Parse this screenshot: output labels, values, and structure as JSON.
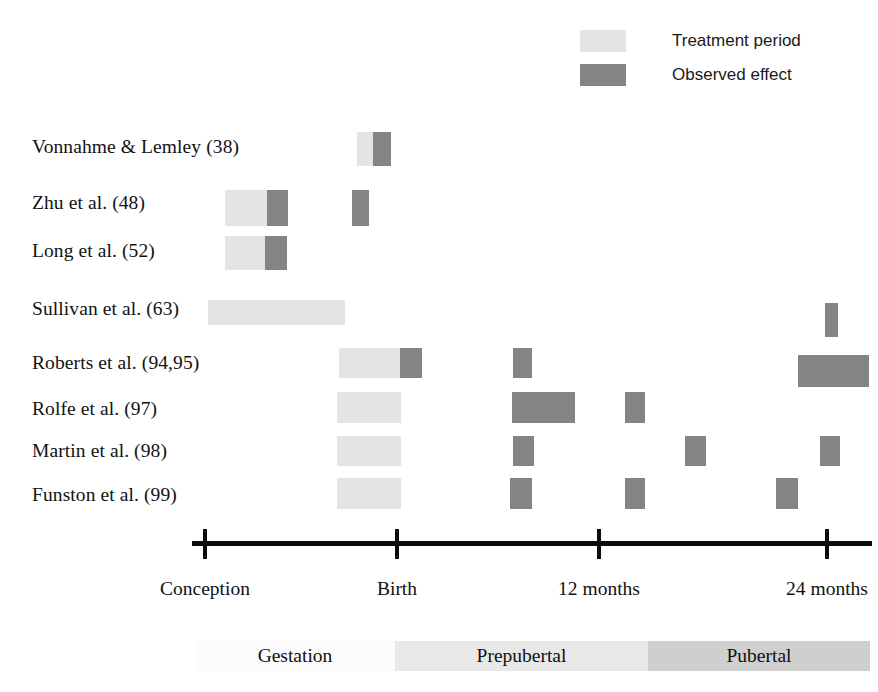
{
  "figure": {
    "type": "timeline-gantt",
    "colors": {
      "treatment": "#e4e4e4",
      "effect": "#848484",
      "axis": "#0b0b0b",
      "stage_gestation": "#fbfbfb",
      "stage_prepubertal": "#e8e8e8",
      "stage_pubertal": "#cfcfcf",
      "background": "#ffffff"
    }
  },
  "legend": {
    "position": "top-right",
    "items": [
      {
        "label": "Treatment period",
        "swatch": "#e4e4e4",
        "key": "treatment"
      },
      {
        "label": "Observed effect",
        "swatch": "#848484",
        "key": "effect"
      }
    ]
  },
  "axis": {
    "ticks": [
      {
        "label": "Conception",
        "x": 205
      },
      {
        "label": "Birth",
        "x": 397
      },
      {
        "label": "12 months",
        "x": 599
      },
      {
        "label": "24 months",
        "x": 827
      }
    ],
    "line_start": 192,
    "line_end": 872
  },
  "stages": [
    {
      "label": "Gestation",
      "from": "Conception",
      "to": "Birth",
      "x": 195,
      "width": 200,
      "color": "#fbfbfb"
    },
    {
      "label": "Prepubertal",
      "from": "Birth",
      "to": "12 months",
      "x": 395,
      "width": 253,
      "color": "#e8e8e8"
    },
    {
      "label": "Pubertal",
      "from": "12 months",
      "to": "24 months",
      "x": 648,
      "width": 222,
      "color": "#cfcfcf"
    }
  ],
  "chart_data": {
    "type": "bar",
    "title": "",
    "xlabel": "",
    "ylabel": "",
    "categories": [
      "Vonnahme & Lemley (38)",
      "Zhu et al. (48)",
      "Long et al. (52)",
      "Sullivan et al. (63)",
      "Roberts et al. (94,95)",
      "Rolfe et al. (97)",
      "Martin et al. (98)",
      "Funston et al. (99)"
    ],
    "x_tick_labels": [
      "Conception",
      "Birth",
      "12 months",
      "24 months"
    ],
    "legend_entries": [
      "Treatment period",
      "Observed effect"
    ],
    "series": [
      {
        "name": "Treatment period",
        "color": "#e4e4e4"
      },
      {
        "name": "Observed effect",
        "color": "#848484"
      }
    ],
    "rows": [
      {
        "label": "Vonnahme & Lemley (38)",
        "y": 132,
        "height": 34,
        "label_y": 136,
        "segments": [
          {
            "kind": "treatment",
            "x": 357,
            "width": 16
          },
          {
            "kind": "effect",
            "x": 373,
            "width": 18
          }
        ]
      },
      {
        "label": "Zhu et al. (48)",
        "y": 190,
        "height": 36,
        "label_y": 192,
        "segments": [
          {
            "kind": "treatment",
            "x": 225,
            "width": 42
          },
          {
            "kind": "effect",
            "x": 267,
            "width": 21
          },
          {
            "kind": "effect",
            "x": 352,
            "width": 17
          }
        ]
      },
      {
        "label": "Long et al. (52)",
        "y": 236,
        "height": 34,
        "label_y": 240,
        "segments": [
          {
            "kind": "treatment",
            "x": 225,
            "width": 40
          },
          {
            "kind": "effect",
            "x": 265,
            "width": 22
          }
        ]
      },
      {
        "label": "Sullivan et al. (63)",
        "y": 300,
        "height": 25,
        "label_y": 298,
        "segments": [
          {
            "kind": "treatment",
            "x": 208,
            "width": 137
          },
          {
            "kind": "effect",
            "x": 825,
            "width": 13,
            "y": 303,
            "height": 34
          }
        ]
      },
      {
        "label": "Roberts et al. (94,95)",
        "y": 348,
        "height": 30,
        "label_y": 352,
        "segments": [
          {
            "kind": "treatment",
            "x": 339,
            "width": 61
          },
          {
            "kind": "effect",
            "x": 400,
            "width": 22
          },
          {
            "kind": "effect",
            "x": 513,
            "width": 19
          },
          {
            "kind": "effect",
            "x": 798,
            "width": 71,
            "y": 355,
            "height": 32
          }
        ]
      },
      {
        "label": "Rolfe et al. (97)",
        "y": 392,
        "height": 31,
        "label_y": 398,
        "segments": [
          {
            "kind": "treatment",
            "x": 337,
            "width": 64
          },
          {
            "kind": "effect",
            "x": 512,
            "width": 63
          },
          {
            "kind": "effect",
            "x": 625,
            "width": 20
          }
        ]
      },
      {
        "label": "Martin et al. (98)",
        "y": 436,
        "height": 30,
        "label_y": 440,
        "segments": [
          {
            "kind": "treatment",
            "x": 337,
            "width": 64
          },
          {
            "kind": "effect",
            "x": 513,
            "width": 21
          },
          {
            "kind": "effect",
            "x": 685,
            "width": 21
          },
          {
            "kind": "effect",
            "x": 820,
            "width": 20
          }
        ]
      },
      {
        "label": "Funston et al. (99)",
        "y": 478,
        "height": 31,
        "label_y": 484,
        "segments": [
          {
            "kind": "treatment",
            "x": 337,
            "width": 64
          },
          {
            "kind": "effect",
            "x": 510,
            "width": 22
          },
          {
            "kind": "effect",
            "x": 625,
            "width": 20
          },
          {
            "kind": "effect",
            "x": 776,
            "width": 22
          }
        ]
      }
    ]
  }
}
